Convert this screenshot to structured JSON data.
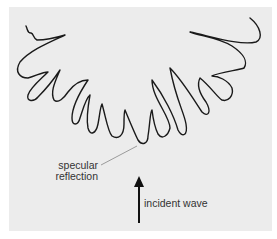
{
  "diagram": {
    "type": "polar scattering pattern",
    "background_color": "#ececec",
    "curve_color": "#1a1a1a",
    "labels": {
      "specular_line1": "specular",
      "specular_line2": "reflection",
      "incident": "incident wave"
    },
    "arrow": {
      "direction": "up",
      "meaning": "incident wave"
    }
  }
}
